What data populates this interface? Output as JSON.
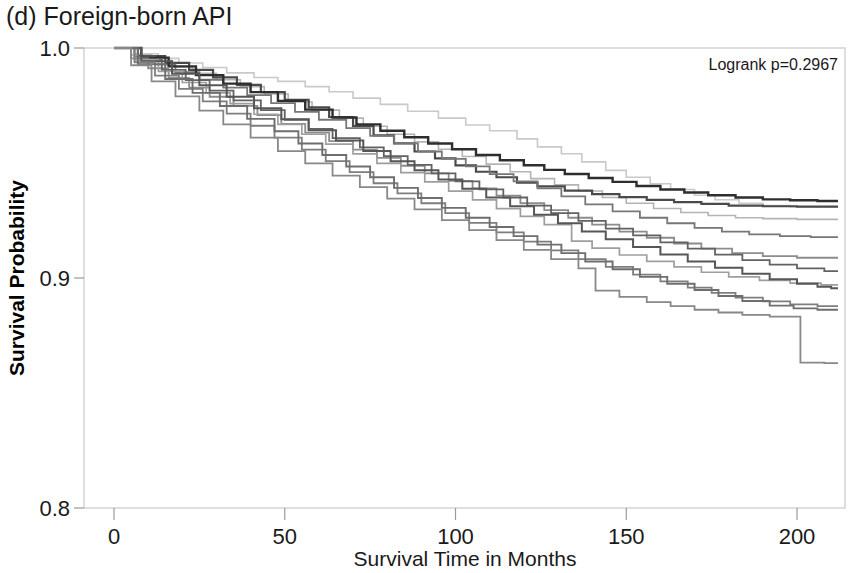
{
  "figure": {
    "panel_label": "(d) Foreign-born API",
    "background": "#ffffff"
  },
  "annotation": {
    "logrank": "Logrank p=0.2967",
    "x": 838,
    "y": 70
  },
  "axes": {
    "x_title": "Survival Time in Months",
    "y_title": "Survival Probability",
    "x_ticks": [
      "0",
      "50",
      "100",
      "150",
      "200"
    ],
    "y_ticks": [
      "1.0",
      "0.9",
      "0.8"
    ]
  },
  "chart_data": {
    "type": "line",
    "subtype": "kaplan-meier-step",
    "title": "(d) Foreign-born API",
    "xlabel": "Survival Time in Months",
    "ylabel": "Survival Probability",
    "xlim": [
      -5,
      215
    ],
    "ylim": [
      0.8,
      1.0
    ],
    "xticks": [
      0,
      50,
      100,
      150,
      200
    ],
    "yticks": [
      1.0,
      0.9,
      0.8
    ],
    "grid": false,
    "legend": "none",
    "annotations": [
      {
        "text": "Logrank p=0.2967",
        "x": 205,
        "y": 0.99
      }
    ],
    "series": [
      {
        "name": "group-1",
        "color": "#c9c9c9",
        "width": 1.6,
        "x": [
          0,
          6,
          13,
          19,
          26,
          33,
          41,
          48,
          56,
          63,
          70,
          78,
          86,
          95,
          103,
          110,
          118,
          124,
          131,
          137,
          144,
          150,
          157,
          163,
          170,
          176,
          183,
          190,
          198,
          212
        ],
        "y": [
          1.0,
          0.9975,
          0.9955,
          0.9935,
          0.9915,
          0.9892,
          0.9872,
          0.9855,
          0.9832,
          0.981,
          0.9782,
          0.9755,
          0.9725,
          0.9695,
          0.9665,
          0.964,
          0.9605,
          0.957,
          0.954,
          0.9505,
          0.9468,
          0.9438,
          0.941,
          0.9385,
          0.936,
          0.934,
          0.9325,
          0.9315,
          0.931,
          0.931
        ]
      },
      {
        "name": "group-2",
        "color": "#b4b4b4",
        "width": 1.6,
        "x": [
          0,
          5,
          11,
          17,
          23,
          30,
          37,
          44,
          51,
          58,
          66,
          73,
          80,
          88,
          95,
          102,
          109,
          116,
          122,
          129,
          136,
          143,
          150,
          158,
          166,
          174,
          182,
          190,
          200,
          212
        ],
        "y": [
          1.0,
          0.997,
          0.9945,
          0.9918,
          0.989,
          0.9862,
          0.9832,
          0.98,
          0.9765,
          0.973,
          0.9695,
          0.966,
          0.9625,
          0.9592,
          0.956,
          0.9528,
          0.9495,
          0.9462,
          0.9432,
          0.9405,
          0.9378,
          0.935,
          0.9325,
          0.9302,
          0.9285,
          0.9272,
          0.9262,
          0.9258,
          0.9255,
          0.9255
        ]
      },
      {
        "name": "group-3",
        "color": "#4a4a4a",
        "width": 2.2,
        "x": [
          0,
          7,
          15,
          22,
          29,
          36,
          43,
          50,
          57,
          63,
          70,
          76,
          82,
          88,
          94,
          100,
          106,
          112,
          118,
          124,
          132,
          140,
          148,
          156,
          164,
          172,
          180,
          190,
          200,
          212
        ],
        "y": [
          1.0,
          0.9965,
          0.9935,
          0.9905,
          0.9872,
          0.984,
          0.9808,
          0.9775,
          0.9742,
          0.97,
          0.966,
          0.962,
          0.9585,
          0.955,
          0.952,
          0.949,
          0.9462,
          0.9438,
          0.9415,
          0.9398,
          0.938,
          0.9365,
          0.9352,
          0.934,
          0.933,
          0.9322,
          0.9315,
          0.9312,
          0.931,
          0.931
        ]
      },
      {
        "name": "group-4",
        "color": "#777777",
        "width": 1.8,
        "x": [
          0,
          6,
          12,
          18,
          25,
          32,
          39,
          46,
          53,
          60,
          68,
          75,
          82,
          89,
          96,
          103,
          110,
          117,
          124,
          131,
          138,
          146,
          154,
          162,
          170,
          178,
          186,
          195,
          204,
          212
        ],
        "y": [
          1.0,
          0.9962,
          0.9928,
          0.9895,
          0.9862,
          0.9828,
          0.9795,
          0.976,
          0.9722,
          0.9688,
          0.9652,
          0.9618,
          0.9585,
          0.955,
          0.9518,
          0.9485,
          0.9452,
          0.942,
          0.939,
          0.9355,
          0.932,
          0.929,
          0.9262,
          0.9238,
          0.9218,
          0.9202,
          0.919,
          0.9182,
          0.9178,
          0.9178
        ]
      },
      {
        "name": "group-5",
        "color": "#2e2e2e",
        "width": 2.4,
        "x": [
          0,
          8,
          16,
          24,
          32,
          40,
          48,
          56,
          64,
          71,
          78,
          85,
          92,
          99,
          106,
          113,
          120,
          126,
          132,
          139,
          146,
          153,
          160,
          167,
          174,
          182,
          190,
          198,
          206,
          212
        ],
        "y": [
          1.0,
          0.9958,
          0.992,
          0.9882,
          0.9845,
          0.9808,
          0.977,
          0.9732,
          0.9698,
          0.9668,
          0.964,
          0.9612,
          0.9585,
          0.956,
          0.9535,
          0.9512,
          0.949,
          0.947,
          0.9452,
          0.9435,
          0.9418,
          0.94,
          0.9385,
          0.9372,
          0.936,
          0.935,
          0.9342,
          0.9338,
          0.9335,
          0.9335
        ]
      },
      {
        "name": "group-6",
        "color": "#8c8c8c",
        "width": 1.8,
        "x": [
          0,
          5,
          10,
          16,
          22,
          28,
          35,
          42,
          49,
          56,
          63,
          70,
          77,
          84,
          91,
          98,
          105,
          112,
          119,
          126,
          133,
          140,
          148,
          156,
          164,
          172,
          181,
          190,
          200,
          212
        ],
        "y": [
          1.0,
          0.9955,
          0.9912,
          0.987,
          0.9828,
          0.9788,
          0.9748,
          0.9708,
          0.967,
          0.9632,
          0.9595,
          0.9558,
          0.9522,
          0.9488,
          0.9455,
          0.9422,
          0.939,
          0.9358,
          0.9325,
          0.9295,
          0.9262,
          0.9232,
          0.9202,
          0.9175,
          0.915,
          0.9128,
          0.9108,
          0.9095,
          0.9088,
          0.9088
        ]
      },
      {
        "name": "group-7",
        "color": "#626262",
        "width": 1.8,
        "x": [
          0,
          7,
          14,
          21,
          28,
          35,
          43,
          50,
          57,
          64,
          72,
          79,
          86,
          93,
          100,
          107,
          114,
          121,
          128,
          136,
          144,
          152,
          160,
          168,
          176,
          184,
          192,
          200,
          208,
          212
        ],
        "y": [
          1.0,
          0.995,
          0.9905,
          0.986,
          0.9815,
          0.9772,
          0.973,
          0.9688,
          0.9648,
          0.9608,
          0.9568,
          0.953,
          0.9492,
          0.9455,
          0.942,
          0.9385,
          0.935,
          0.9315,
          0.9282,
          0.9248,
          0.9215,
          0.9185,
          0.9155,
          0.9128,
          0.9102,
          0.9078,
          0.9058,
          0.9042,
          0.903,
          0.903
        ]
      },
      {
        "name": "group-8",
        "color": "#9e9e9e",
        "width": 1.7,
        "x": [
          0,
          6,
          13,
          20,
          27,
          34,
          41,
          48,
          55,
          62,
          70,
          77,
          84,
          91,
          98,
          105,
          112,
          119,
          126,
          134,
          140,
          148,
          156,
          164,
          172,
          180,
          189,
          198,
          207,
          212
        ],
        "y": [
          1.0,
          0.9948,
          0.9898,
          0.985,
          0.9805,
          0.9758,
          0.9712,
          0.9668,
          0.9625,
          0.9582,
          0.954,
          0.9498,
          0.9458,
          0.9418,
          0.9378,
          0.934,
          0.9302,
          0.9268,
          0.9232,
          0.916,
          0.913,
          0.91,
          0.9072,
          0.9048,
          0.9025,
          0.9005,
          0.899,
          0.8978,
          0.897,
          0.897
        ]
      },
      {
        "name": "group-9",
        "color": "#565656",
        "width": 2.0,
        "x": [
          0,
          8,
          17,
          25,
          33,
          41,
          49,
          57,
          65,
          73,
          81,
          88,
          95,
          102,
          109,
          116,
          123,
          130,
          137,
          144,
          152,
          160,
          168,
          176,
          184,
          192,
          200,
          206,
          210,
          212
        ],
        "y": [
          1.0,
          0.9942,
          0.9888,
          0.9838,
          0.9788,
          0.9738,
          0.969,
          0.9642,
          0.9598,
          0.9552,
          0.9508,
          0.9468,
          0.9428,
          0.9388,
          0.935,
          0.9312,
          0.9275,
          0.9238,
          0.9202,
          0.9168,
          0.9135,
          0.9102,
          0.9072,
          0.9045,
          0.9018,
          0.8995,
          0.8975,
          0.8962,
          0.8955,
          0.8955
        ]
      },
      {
        "name": "group-10",
        "color": "#7e7e7e",
        "width": 1.8,
        "x": [
          0,
          6,
          12,
          19,
          26,
          33,
          40,
          47,
          55,
          62,
          69,
          76,
          83,
          90,
          97,
          104,
          112,
          120,
          128,
          136,
          144,
          152,
          160,
          168,
          175,
          182,
          190,
          198,
          206,
          212
        ],
        "y": [
          1.0,
          0.9938,
          0.988,
          0.9822,
          0.9768,
          0.9715,
          0.9662,
          0.961,
          0.9558,
          0.9508,
          0.946,
          0.9412,
          0.9368,
          0.9325,
          0.9282,
          0.924,
          0.9198,
          0.9158,
          0.912,
          0.9082,
          0.9048,
          0.9015,
          0.8985,
          0.8958,
          0.8935,
          0.8915,
          0.8898,
          0.8885,
          0.8878,
          0.8878
        ]
      },
      {
        "name": "group-11",
        "color": "#6e6e6e",
        "width": 1.9,
        "x": [
          0,
          7,
          15,
          23,
          31,
          39,
          47,
          54,
          61,
          68,
          75,
          82,
          89,
          96,
          103,
          110,
          117,
          124,
          131,
          138,
          146,
          154,
          162,
          170,
          177,
          184,
          192,
          199,
          206,
          212
        ],
        "y": [
          1.0,
          0.993,
          0.9865,
          0.9805,
          0.9748,
          0.9692,
          0.9638,
          0.9585,
          0.9535,
          0.9485,
          0.9438,
          0.9392,
          0.9348,
          0.9305,
          0.9262,
          0.9222,
          0.9182,
          0.9145,
          0.9108,
          0.9072,
          0.9038,
          0.9005,
          0.8975,
          0.8948,
          0.8922,
          0.89,
          0.888,
          0.8868,
          0.8862,
          0.8862
        ]
      },
      {
        "name": "group-12",
        "color": "#888888",
        "width": 1.8,
        "x": [
          0,
          5,
          11,
          18,
          25,
          32,
          40,
          48,
          56,
          64,
          72,
          80,
          88,
          96,
          104,
          112,
          120,
          128,
          136,
          141,
          148,
          156,
          163,
          170,
          177,
          184,
          192,
          201,
          208,
          212
        ],
        "y": [
          1.0,
          0.9925,
          0.9855,
          0.979,
          0.9728,
          0.9668,
          0.961,
          0.9552,
          0.9498,
          0.9445,
          0.9395,
          0.9345,
          0.9298,
          0.9252,
          0.9208,
          0.9165,
          0.9122,
          0.9082,
          0.9042,
          0.8945,
          0.8918,
          0.8895,
          0.8878,
          0.8862,
          0.885,
          0.884,
          0.8832,
          0.8632,
          0.863,
          0.863
        ]
      }
    ]
  },
  "geometry": {
    "plot_left": 84,
    "plot_right": 845,
    "plot_top": 48,
    "plot_bottom": 508,
    "x0_px": 114,
    "x200_px": 797,
    "y_1_0_px": 48,
    "y_0_9_px": 275,
    "y_0_8_px": 508
  }
}
